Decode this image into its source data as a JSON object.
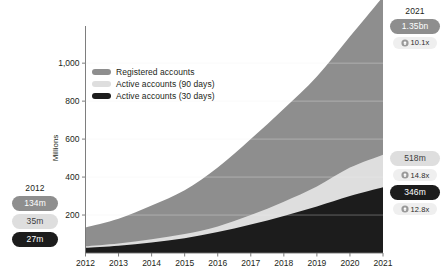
{
  "legend": {
    "items": [
      {
        "label": "Registered accounts",
        "color": "#8e8e8e",
        "key": "registered"
      },
      {
        "label": "Active accounts (90 days)",
        "color": "#dedede",
        "key": "active90"
      },
      {
        "label": "Active accounts (30 days)",
        "color": "#1c1c1c",
        "key": "active30"
      }
    ]
  },
  "annotations": {
    "left": {
      "year": "2012",
      "pills": [
        {
          "value": "134m",
          "series": "registered"
        },
        {
          "value": "35m",
          "series": "active90"
        },
        {
          "value": "27m",
          "series": "active30"
        }
      ]
    },
    "right_top": {
      "year": "2021",
      "pills": [
        {
          "value": "1.35bn",
          "series": "registered"
        }
      ],
      "growth": [
        {
          "value": "10.1x",
          "icon": "growth-up-icon"
        }
      ]
    },
    "right_mid": {
      "year": "",
      "pills": [
        {
          "value": "518m",
          "series": "active90"
        },
        {
          "value": "346m",
          "series": "active30"
        }
      ],
      "growth": [
        {
          "value": "14.8x",
          "icon": "growth-up-icon"
        },
        {
          "value": "12.8x",
          "icon": "growth-up-icon"
        }
      ]
    }
  },
  "chart_data": {
    "type": "area",
    "title": "",
    "subtitle": "",
    "xlabel": "",
    "ylabel": "Millions",
    "grid": false,
    "legend_position": "top-left",
    "overlap": "overlaid",
    "x": [
      2012,
      2013,
      2014,
      2015,
      2016,
      2017,
      2018,
      2019,
      2020,
      2021
    ],
    "categories": [
      "2012",
      "2013",
      "2014",
      "2015",
      "2016",
      "2017",
      "2018",
      "2019",
      "2020",
      "2021"
    ],
    "xtick_labels": [
      "2012",
      "2013",
      "2014",
      "2015",
      "2016",
      "2017",
      "2018",
      "2019",
      "2020",
      "2021"
    ],
    "ytick_labels": [
      "200",
      "400",
      "600",
      "800",
      "1,000"
    ],
    "yticks": [
      200,
      400,
      600,
      800,
      1000
    ],
    "ylim": [
      0,
      1180
    ],
    "xlim": [
      2012,
      2021
    ],
    "series": [
      {
        "name": "Registered accounts",
        "color": "#8e8e8e",
        "values": [
          134,
          180,
          250,
          330,
          450,
          600,
          760,
          930,
          1140,
          1350
        ]
      },
      {
        "name": "Active accounts (90 days)",
        "color": "#dedede",
        "values": [
          35,
          50,
          72,
          100,
          140,
          200,
          270,
          350,
          450,
          518
        ]
      },
      {
        "name": "Active accounts (30 days)",
        "color": "#1c1c1c",
        "values": [
          27,
          38,
          55,
          78,
          110,
          150,
          195,
          245,
          300,
          346
        ]
      }
    ]
  }
}
